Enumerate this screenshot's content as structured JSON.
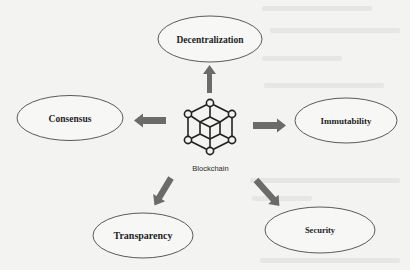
{
  "diagram": {
    "center": {
      "label": "Blockchain",
      "icon": "blockchain-cube-network-icon"
    },
    "nodes": [
      {
        "id": "decentralization",
        "label": "Decentralization"
      },
      {
        "id": "consensus",
        "label": "Consensus"
      },
      {
        "id": "immutability",
        "label": "Immutability"
      },
      {
        "id": "transparency",
        "label": "Transparency"
      },
      {
        "id": "security",
        "label": "Security"
      }
    ],
    "edges": [
      {
        "from": "Blockchain",
        "to": "Decentralization"
      },
      {
        "from": "Blockchain",
        "to": "Consensus"
      },
      {
        "from": "Blockchain",
        "to": "Immutability"
      },
      {
        "from": "Blockchain",
        "to": "Transparency"
      },
      {
        "from": "Blockchain",
        "to": "Security"
      }
    ],
    "colors": {
      "background": "#f3f3f2",
      "arrow": "#6b6b6b",
      "ellipse_stroke": "#5a5a5a",
      "icon_stroke": "#222222"
    }
  }
}
